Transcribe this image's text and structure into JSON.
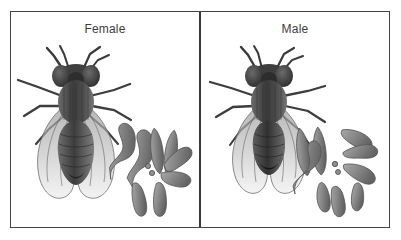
{
  "figure": {
    "type": "biology-comparison-diagram",
    "organism": "Drosophila (fruit fly)",
    "background_color": "#ffffff",
    "frame_color": "#444444",
    "divider_color": "#3a3a3a",
    "label_color": "#3d3d3d",
    "ink_color": "#4f4f4f",
    "chromosome_fill": "#8e8e8e",
    "chromosome_outline": "#5a5a5a"
  },
  "panels": [
    {
      "id": "female",
      "label": "Female",
      "fly": {
        "name": "female-fruit-fly-illustration",
        "abdomen_shape": "rounded, larger, pale-tipped",
        "wing_count": 2,
        "leg_count": 6
      },
      "karyotype": {
        "name": "female-karyotype",
        "chromosome_count": 8,
        "sex_chromosomes": "XX",
        "pairs": [
          {
            "name": "chromosome-2-pair",
            "shape": "V-shaped metacentric",
            "count": 2
          },
          {
            "name": "chromosome-3-pair",
            "shape": "V-shaped metacentric",
            "count": 2
          },
          {
            "name": "chromosome-4-pair",
            "shape": "dot",
            "count": 2
          },
          {
            "name": "sex-chromosome-pair",
            "shape": "rod (X and X)",
            "count": 2
          }
        ]
      }
    },
    {
      "id": "male",
      "label": "Male",
      "fly": {
        "name": "male-fruit-fly-illustration",
        "abdomen_shape": "blunt, smaller, dark-tipped",
        "wing_count": 2,
        "leg_count": 6
      },
      "karyotype": {
        "name": "male-karyotype",
        "chromosome_count": 8,
        "sex_chromosomes": "XY",
        "pairs": [
          {
            "name": "chromosome-2-pair",
            "shape": "V-shaped metacentric",
            "count": 2
          },
          {
            "name": "chromosome-3-pair",
            "shape": "V-shaped metacentric",
            "count": 2
          },
          {
            "name": "chromosome-4-pair",
            "shape": "dot",
            "count": 2
          },
          {
            "name": "sex-chromosome-pair",
            "shape": "rod X and hooked Y",
            "count": 2
          }
        ]
      }
    }
  ]
}
